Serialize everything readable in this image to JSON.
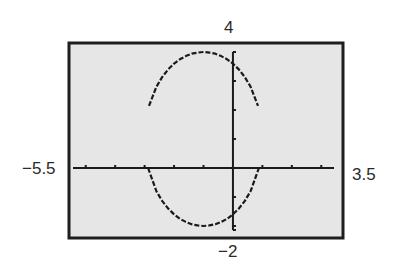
{
  "chart_data": {
    "type": "line",
    "title": "",
    "xlabel": "",
    "ylabel": "",
    "window": {
      "xmin": -5.5,
      "xmax": 3.5,
      "ymin": -2,
      "ymax": 4,
      "xscl": 1,
      "yscl": 1
    },
    "xlim": [
      -5.5,
      3.5
    ],
    "ylim": [
      -2,
      4
    ],
    "grid": false,
    "axes_visible": true,
    "window_labels": {
      "ymax": "4",
      "ymin": "−2",
      "xmin": "−5.5",
      "xmax": "3.5"
    },
    "series": [
      {
        "name": "upper",
        "x": [
          -2.85,
          -2.6,
          -2.4,
          -2.2,
          -2.0,
          -1.8,
          -1.6,
          -1.4,
          -1.2,
          -1.0,
          -0.8,
          -0.6,
          -0.4,
          -0.2,
          0.0,
          0.2,
          0.4,
          0.6,
          0.85
        ],
        "y": [
          2.14,
          2.8,
          3.14,
          3.4,
          3.6,
          3.75,
          3.86,
          3.94,
          3.98,
          4.0,
          3.98,
          3.94,
          3.86,
          3.75,
          3.6,
          3.4,
          3.14,
          2.8,
          2.14
        ]
      },
      {
        "name": "lower",
        "x": [
          -2.88,
          -2.6,
          -2.4,
          -2.2,
          -2.0,
          -1.8,
          -1.6,
          -1.4,
          -1.2,
          -1.0,
          -0.8,
          -0.6,
          -0.4,
          -0.2,
          0.0,
          0.2,
          0.4,
          0.6,
          0.88
        ],
        "y": [
          0.0,
          -0.8,
          -1.14,
          -1.4,
          -1.6,
          -1.75,
          -1.86,
          -1.94,
          -1.98,
          -2.0,
          -1.98,
          -1.94,
          -1.86,
          -1.75,
          -1.6,
          -1.4,
          -1.14,
          -0.8,
          0.0
        ]
      }
    ],
    "colors": {
      "screen_bg": "#e6e6e6",
      "frame": "#1e1e1e",
      "curve": "#1a1a1a",
      "axes": "#1a1a1a"
    }
  }
}
